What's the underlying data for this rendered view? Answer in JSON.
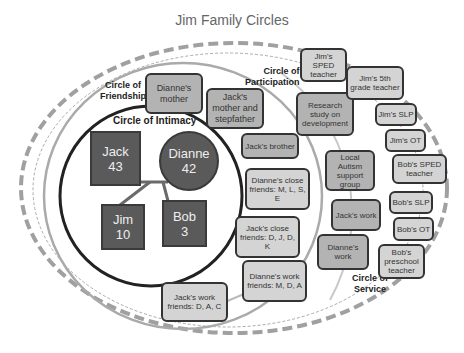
{
  "title": "Jim Family Circles",
  "circles": {
    "intimacy": "Circle of Intimacy",
    "friendship_1": "Circle of",
    "friendship_2": "Friendship",
    "participation_1": "Circle of",
    "participation_2": "Participation",
    "service_1": "Circle of",
    "service_2": "Service"
  },
  "intimacy_members": [
    {
      "name": "Jack",
      "age": "43",
      "shape": "square"
    },
    {
      "name": "Dianne",
      "age": "42",
      "shape": "circle"
    },
    {
      "name": "Jim",
      "age": "10",
      "shape": "square"
    },
    {
      "name": "Bob",
      "age": "3",
      "shape": "square"
    }
  ],
  "friendship_boxes": [
    "Dianne's mother",
    "Jack's mother and stepfather",
    "Jack's  brother",
    "Dianne's close friends: M, L, S, E",
    "Jack's close friends: D, J, D, K",
    "Dianne's work friends: M, D,  A",
    "Jack's work friends: D, A, C"
  ],
  "participation_boxes": [
    "Research study on development",
    "Local Autism support group",
    "Jack's work",
    "Dianne's work"
  ],
  "service_boxes": [
    "Jim's SPED teacher",
    "Jim's 5th grade teacher",
    "Jim's SLP",
    "Jim's OT",
    "Bob's SPED teacher",
    "Bob's SLP",
    "Bob's OT",
    "Bob's preschool teacher"
  ],
  "colors": {
    "dark_node": "#5a5a5a",
    "mid_box": "#b3b3b3",
    "light_box": "#d4d4d4",
    "outline": "#333333",
    "ring_gray": "#aaaaaa"
  }
}
